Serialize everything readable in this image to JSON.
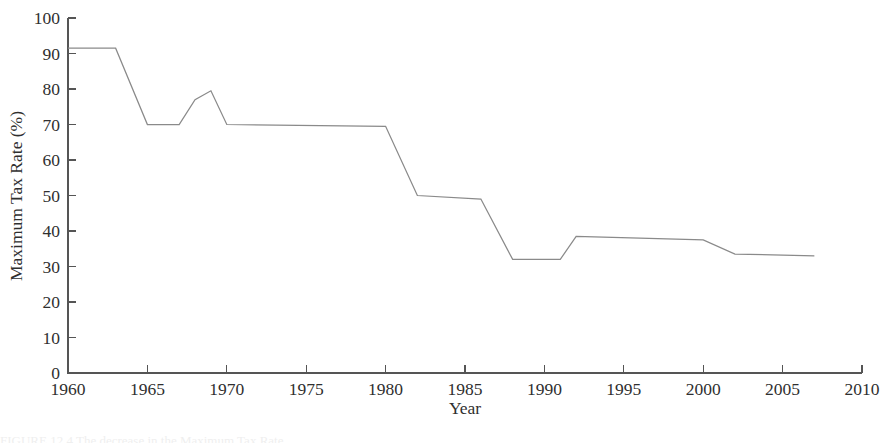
{
  "figure": {
    "background_color": "#ffffff",
    "line_color": "#8a8a8a",
    "axis_color": "#555555",
    "text_color": "#2f2f2f",
    "caption_partial": "FIGURE 12.4  The decrease in the Maximum Tax Rate"
  },
  "chart_data": {
    "type": "line",
    "title": "",
    "xlabel": "Year",
    "ylabel": "Maximum Tax Rate (%)",
    "xlim": [
      1960,
      2010
    ],
    "ylim": [
      0,
      100
    ],
    "grid": false,
    "legend": "none",
    "xticks": [
      1960,
      1965,
      1970,
      1975,
      1980,
      1985,
      1990,
      1995,
      2000,
      2005,
      2010
    ],
    "xtick_labels": [
      "1960",
      "1965",
      "1970",
      "1975",
      "1980",
      "1985",
      "1990",
      "1995",
      "2000",
      "2005",
      "2010"
    ],
    "yticks": [
      0,
      10,
      20,
      30,
      40,
      50,
      60,
      70,
      80,
      90,
      100
    ],
    "ytick_labels": [
      "0",
      "10",
      "20",
      "30",
      "40",
      "50",
      "60",
      "70",
      "80",
      "90",
      "100"
    ],
    "series": [
      {
        "name": "Maximum Tax Rate",
        "color": "#8a8a8a",
        "x": [
          1960,
          1963,
          1965,
          1967,
          1968,
          1969,
          1970,
          1980,
          1982,
          1986,
          1988,
          1991,
          1992,
          2000,
          2002,
          2007
        ],
        "y": [
          91.5,
          91.5,
          70.0,
          70.0,
          77.0,
          79.5,
          70.0,
          69.5,
          50.0,
          49.0,
          32.0,
          32.0,
          38.5,
          37.5,
          33.5,
          33.0
        ]
      }
    ]
  }
}
